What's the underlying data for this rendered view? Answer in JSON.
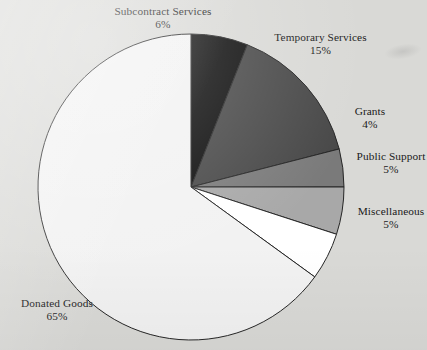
{
  "figure": {
    "background_color": "#d9d9d6",
    "outline_color": "#262626",
    "artifact_label": "scan-smudge"
  },
  "chart_data": {
    "type": "pie",
    "title": "",
    "subtitle": "",
    "xlabel": "",
    "ylabel": "",
    "grid": false,
    "legend_position": "none",
    "labels_position": "outside-callout",
    "start_angle_deg": 0,
    "direction": "clockwise",
    "units": "percent",
    "total": 100,
    "categories": [
      "Subcontract Services",
      "Temporary Services",
      "Grants",
      "Public Support",
      "Miscellaneous",
      "Donated Goods"
    ],
    "values": [
      6,
      15,
      4,
      5,
      5,
      65
    ],
    "value_labels": [
      "6%",
      "15%",
      "4%",
      "5%",
      "5%",
      "65%"
    ],
    "colors": [
      "#0d0d0d",
      "#484848",
      "#7a7a7a",
      "#a8a8a8",
      "#ffffff",
      "#f2f2f2"
    ],
    "slices": [
      {
        "label": "Subcontract Services",
        "value": 6,
        "value_label": "6%",
        "color": "#0d0d0d",
        "start_deg": 0,
        "end_deg": 21.6
      },
      {
        "label": "Temporary Services",
        "value": 15,
        "value_label": "15%",
        "color": "#484848",
        "start_deg": 21.6,
        "end_deg": 75.6
      },
      {
        "label": "Grants",
        "value": 4,
        "value_label": "4%",
        "color": "#7a7a7a",
        "start_deg": 75.6,
        "end_deg": 90
      },
      {
        "label": "Public Support",
        "value": 5,
        "value_label": "5%",
        "color": "#a8a8a8",
        "start_deg": 90,
        "end_deg": 108
      },
      {
        "label": "Miscellaneous",
        "value": 5,
        "value_label": "5%",
        "color": "#ffffff",
        "start_deg": 108,
        "end_deg": 126
      },
      {
        "label": "Donated Goods",
        "value": 65,
        "value_label": "65%",
        "color": "#f2f2f2",
        "start_deg": 126,
        "end_deg": 360
      }
    ]
  }
}
